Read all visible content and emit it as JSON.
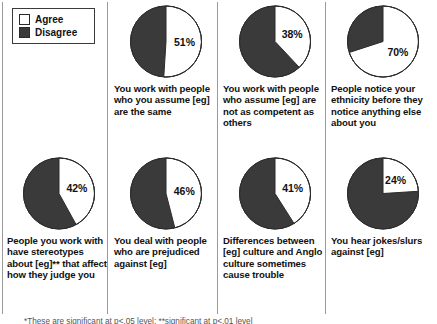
{
  "legend": {
    "title": "legend",
    "items": [
      {
        "label": "Agree",
        "color": "#ffffff"
      },
      {
        "label": "Disagree",
        "color": "#3a3a3a"
      }
    ]
  },
  "footnote": {
    "text": "*These are significant at p<.05 level; **significant at p<.01 level"
  },
  "chart_data": {
    "type": "pie",
    "title": "",
    "legend_position": "top-left",
    "categories": [
      "Agree",
      "Disagree"
    ],
    "colors": {
      "Agree": "#ffffff",
      "Disagree": "#3a3a3a"
    },
    "start_angle_deg": 0,
    "direction": "clockwise",
    "charts": [
      {
        "id": "pie-assume-same",
        "label": "You work with people who you assume [eg] are the same",
        "value_label": "51%",
        "values": {
          "Agree": 51,
          "Disagree": 49
        }
      },
      {
        "id": "pie-assume-not-competent",
        "label": "You work with people who  assume [eg] are not as competent as others",
        "value_label": "38%",
        "values": {
          "Agree": 38,
          "Disagree": 62
        }
      },
      {
        "id": "pie-notice-ethnicity",
        "label": "People notice your ethnicity before they notice anything else about you",
        "value_label": "70%",
        "values": {
          "Agree": 70,
          "Disagree": 30
        }
      },
      {
        "id": "pie-stereotypes",
        "label": "People you work with have stereotypes about [eg]** that affect how they judge you",
        "value_label": "42%",
        "values": {
          "Agree": 42,
          "Disagree": 58
        }
      },
      {
        "id": "pie-prejudiced",
        "label": "You deal with people who are prejudiced against [eg]",
        "value_label": "46%",
        "values": {
          "Agree": 46,
          "Disagree": 54
        }
      },
      {
        "id": "pie-culture-differences",
        "label": "Differences between [eg] culture and Anglo culture sometimes cause trouble",
        "value_label": "41%",
        "values": {
          "Agree": 41,
          "Disagree": 59
        }
      },
      {
        "id": "pie-jokes-slurs",
        "label": "You hear jokes/slurs against [eg]",
        "value_label": "24%",
        "values": {
          "Agree": 24,
          "Disagree": 76
        }
      }
    ]
  }
}
